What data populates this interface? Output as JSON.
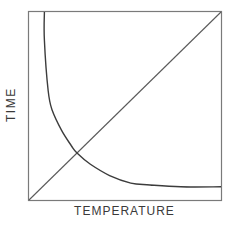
{
  "chart_data": {
    "type": "line",
    "title": "",
    "xlabel": "TEMPERATURE",
    "ylabel": "TIME",
    "xlim": [
      0,
      1
    ],
    "ylim": [
      0,
      1
    ],
    "grid": false,
    "legend": null,
    "ticks": {
      "x": [],
      "y": []
    },
    "series": [
      {
        "name": "linear",
        "shape": "straight diagonal line",
        "x": [
          0,
          1
        ],
        "y": [
          0,
          1
        ]
      },
      {
        "name": "inverse-decay",
        "shape": "hyperbolic decay curve",
        "x": [
          0.08,
          0.08,
          0.1,
          0.12,
          0.17,
          0.22,
          0.25,
          0.32,
          0.42,
          0.53,
          0.63,
          0.79,
          1.0
        ],
        "y": [
          1.0,
          0.85,
          0.58,
          0.48,
          0.37,
          0.29,
          0.25,
          0.19,
          0.13,
          0.09,
          0.08,
          0.07,
          0.07
        ]
      }
    ],
    "annotations": [
      {
        "type": "intersection",
        "x": 0.25,
        "y": 0.25
      }
    ]
  },
  "labels": {
    "x_axis": "TEMPERATURE",
    "y_axis": "TIME"
  },
  "colors": {
    "frame": "#7a7a7a",
    "curve": "#3c3c3c",
    "diagonal": "#5a5a5a",
    "text": "#3a3a3a"
  }
}
